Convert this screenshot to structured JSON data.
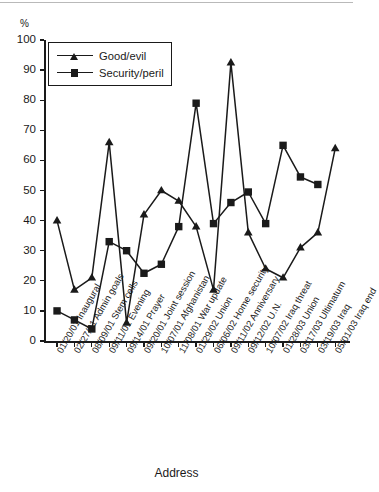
{
  "figure": {
    "y_axis_unit_label": "%",
    "x_axis_title": "Address"
  },
  "legend": {
    "position": "top-left-inside",
    "entries": [
      {
        "label": "Good/evil",
        "marker": "triangle",
        "color": "#1a1a1a"
      },
      {
        "label": "Security/peril",
        "marker": "square",
        "color": "#1a1a1a"
      }
    ]
  },
  "axes": {
    "y_ticks": [
      100,
      90,
      80,
      70,
      60,
      50,
      40,
      30,
      20,
      10,
      0
    ],
    "y_min": 0,
    "y_max": 100
  },
  "chart_data": {
    "type": "line",
    "title": "",
    "subtitle": "",
    "xlabel": "Address",
    "ylabel": "%",
    "ylim": [
      0,
      100
    ],
    "xlim_categories": 18,
    "grid": false,
    "legend_position": "upper left (inside plot)",
    "categories": [
      "01/20/01 Inaugural",
      "02/27/01 Admin goals",
      "08/09/01 Stem cells",
      "09/11/01 Evening",
      "09/14/01 Prayer",
      "09/20/01 Joint session",
      "10/07/01 Afghanistan",
      "11/08/01 War update",
      "01/29/02 Union",
      "06/06/02 Home security",
      "09/11/02 Anniversary",
      "09/12/02 U.N.",
      "10/07/02 Iraq threat",
      "01/28/03 Union",
      "03/17/03 Ultimatum",
      "03/19/03 Iraq",
      "05/01/03 Iraq end"
    ],
    "series": [
      {
        "name": "Good/evil",
        "marker": "triangle",
        "color": "#1a1a1a",
        "values": [
          40,
          17,
          21,
          66,
          6,
          42,
          50,
          46.5,
          38,
          17,
          92.5,
          36,
          24,
          21,
          31,
          36,
          64
        ]
      },
      {
        "name": "Security/peril",
        "marker": "square",
        "color": "#1a1a1a",
        "values": [
          10,
          7,
          4,
          33,
          30,
          22.5,
          25.5,
          38,
          79,
          39,
          46,
          49.5,
          39,
          65,
          54.5,
          52,
          null
        ]
      }
    ]
  }
}
